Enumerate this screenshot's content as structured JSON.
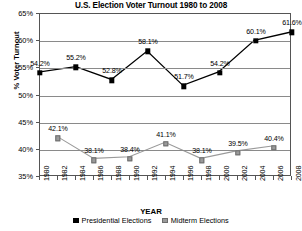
{
  "chart_data": {
    "type": "line",
    "title": "U.S. Election Voter Turnout 1980 to 2008",
    "xlabel": "YEAR",
    "ylabel": "% Voter Turnout",
    "ylim": [
      35,
      65
    ],
    "ytick_labels": [
      "65%",
      "60%",
      "55%",
      "50%",
      "45%",
      "40%",
      "35%"
    ],
    "ytick_values": [
      65,
      60,
      55,
      50,
      45,
      40,
      35
    ],
    "xlim": [
      1980,
      2008
    ],
    "x": [
      1980,
      1982,
      1984,
      1986,
      1988,
      1990,
      1992,
      1994,
      1996,
      1998,
      2000,
      2002,
      2004,
      2006,
      2008
    ],
    "xtick_labels": [
      "1980",
      "1982",
      "1984",
      "1986",
      "1988",
      "1990",
      "1992",
      "1994",
      "1996",
      "1998",
      "2000",
      "2002",
      "2004",
      "2006",
      "2008"
    ],
    "grid": true,
    "legend_position": "bottom",
    "series": [
      {
        "name": "Presidential Elections",
        "color": "#000000",
        "marker": "square-filled",
        "x": [
          1980,
          1984,
          1988,
          1992,
          1996,
          2000,
          2004,
          2008
        ],
        "values": [
          54.2,
          55.2,
          52.8,
          58.1,
          51.7,
          54.2,
          60.1,
          61.6
        ],
        "labels": [
          "54.2%",
          "55.2%",
          "52.8%",
          "58.1%",
          "51.7%",
          "54.2%",
          "60.1%",
          "61.6%"
        ]
      },
      {
        "name": "Midterm Elections",
        "color": "#9a9a9a",
        "marker": "square-gray",
        "x": [
          1982,
          1986,
          1990,
          1994,
          1998,
          2002,
          2006
        ],
        "values": [
          42.1,
          38.1,
          38.4,
          41.1,
          38.1,
          39.5,
          40.4
        ],
        "labels": [
          "42.1%",
          "38.1%",
          "38.4%",
          "41.1%",
          "38.1%",
          "39.5%",
          "40.4%"
        ]
      }
    ]
  },
  "legend": {
    "items": [
      {
        "label": "Presidential Elections"
      },
      {
        "label": "Midterm Elections"
      }
    ]
  },
  "colors": {
    "presidential": "#000000",
    "midterm": "#9a9a9a",
    "grid": "#8a8a8a",
    "axis": "#555555",
    "background": "#ffffff"
  }
}
